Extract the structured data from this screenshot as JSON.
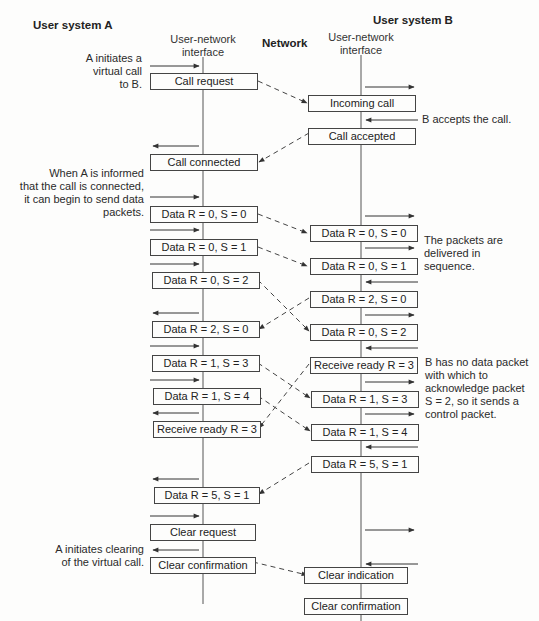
{
  "headers": {
    "user_system_a": "User system A",
    "user_system_b": "User system B",
    "network": "Network",
    "interface_a": "User-network\ninterface",
    "interface_b": "User-network\ninterface"
  },
  "notes": {
    "a_initiates": "A initiates a\nvirtual call\nto B.",
    "b_accepts": "B accepts the call.",
    "a_informed": "When A is informed\nthat the call is connected,\nit can begin to send data\npackets.",
    "delivered_in_sequence": "The packets are\ndelivered in\nsequence.",
    "b_no_data": "B has no data packet\nwith which to\nacknowledge packet\nS = 2, so it sends a\ncontrol packet.",
    "a_clearing": "A initiates clearing\nof the virtual call."
  },
  "side_a": {
    "packets": [
      {
        "label": "Call request"
      },
      {
        "label": "Call connected"
      },
      {
        "label": "Data R = 0, S = 0"
      },
      {
        "label": "Data R = 0, S = 1"
      },
      {
        "label": "Data R = 0, S = 2"
      },
      {
        "label": "Data R = 2, S = 0"
      },
      {
        "label": "Data R = 1, S = 3"
      },
      {
        "label": "Data R = 1, S = 4"
      },
      {
        "label": "Receive ready R = 3"
      },
      {
        "label": "Data R = 5, S = 1"
      },
      {
        "label": "Clear request"
      },
      {
        "label": "Clear confirmation"
      }
    ]
  },
  "side_b": {
    "packets": [
      {
        "label": "Incoming call"
      },
      {
        "label": "Call accepted"
      },
      {
        "label": "Data R = 0, S = 0"
      },
      {
        "label": "Data R = 0, S = 1"
      },
      {
        "label": "Data R = 2, S = 0"
      },
      {
        "label": "Data R = 0, S = 2"
      },
      {
        "label": "Receive ready R = 3"
      },
      {
        "label": "Data R = 1, S = 3"
      },
      {
        "label": "Data R = 1, S = 4"
      },
      {
        "label": "Data R = 5, S = 1"
      },
      {
        "label": "Clear indication"
      },
      {
        "label": "Clear confirmation"
      }
    ]
  },
  "colors": {
    "line": "#444444",
    "text": "#222222",
    "background": "#fdfdfc"
  }
}
